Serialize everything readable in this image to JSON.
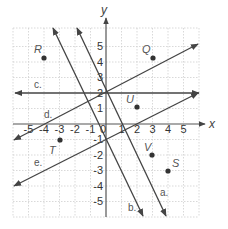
{
  "diagram": {
    "type": "coordinate-plane",
    "axes": {
      "x_label": "x",
      "y_label": "y",
      "x_ticks": [
        "-5",
        "-4",
        "-3",
        "-2",
        "-1",
        "1",
        "2",
        "3",
        "4",
        "5"
      ],
      "y_ticks": [
        "5",
        "4",
        "3",
        "2",
        "1",
        "-1",
        "-2",
        "-3",
        "-4",
        "-5"
      ],
      "origin_label": "0"
    },
    "points": [
      {
        "label": "R",
        "x": -4,
        "y": 4
      },
      {
        "label": "Q",
        "x": 3,
        "y": 4
      },
      {
        "label": "U",
        "x": 2,
        "y": 1
      },
      {
        "label": "T",
        "x": -3,
        "y": -1
      },
      {
        "label": "V",
        "x": 3,
        "y": -2
      },
      {
        "label": "S",
        "x": 4,
        "y": -3
      }
    ],
    "lines": [
      {
        "label": "a.",
        "equation": "y = -2x + 2"
      },
      {
        "label": "b.",
        "equation": "y = -2x - 1"
      },
      {
        "label": "c.",
        "equation": "y = 2"
      },
      {
        "label": "d.",
        "equation": "y = 0.5x + 2"
      },
      {
        "label": "e.",
        "equation": "y = 0.5x - 1"
      }
    ]
  }
}
